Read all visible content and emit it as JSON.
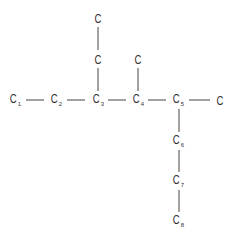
{
  "diagram": {
    "type": "skeletal-carbon-chain",
    "atoms": [
      {
        "id": "c1",
        "symbol": "C",
        "sub": "1",
        "x": 15,
        "y": 101
      },
      {
        "id": "c2",
        "symbol": "C",
        "sub": "2",
        "x": 56,
        "y": 101
      },
      {
        "id": "c3",
        "symbol": "C",
        "sub": "3",
        "x": 98,
        "y": 101
      },
      {
        "id": "c4",
        "symbol": "C",
        "sub": "4",
        "x": 138,
        "y": 101
      },
      {
        "id": "c5",
        "symbol": "C",
        "sub": "5",
        "x": 178,
        "y": 101
      },
      {
        "id": "c5-methyl",
        "symbol": "C",
        "sub": "",
        "x": 220,
        "y": 101
      },
      {
        "id": "c4-methyl",
        "symbol": "C",
        "sub": "",
        "x": 138,
        "y": 60
      },
      {
        "id": "c3-ethyl-1",
        "symbol": "C",
        "sub": "",
        "x": 98,
        "y": 60
      },
      {
        "id": "c3-ethyl-2",
        "symbol": "C",
        "sub": "",
        "x": 98,
        "y": 19
      },
      {
        "id": "c6",
        "symbol": "C",
        "sub": "6",
        "x": 178,
        "y": 142
      },
      {
        "id": "c7",
        "symbol": "C",
        "sub": "7",
        "x": 178,
        "y": 182
      },
      {
        "id": "c8",
        "symbol": "C",
        "sub": "8",
        "x": 178,
        "y": 222
      }
    ],
    "bonds": [
      {
        "x1": 26,
        "y1": 100,
        "x2": 44,
        "y2": 100
      },
      {
        "x1": 67,
        "y1": 100,
        "x2": 85,
        "y2": 100
      },
      {
        "x1": 108,
        "y1": 100,
        "x2": 126,
        "y2": 100
      },
      {
        "x1": 148,
        "y1": 100,
        "x2": 166,
        "y2": 100
      },
      {
        "x1": 189,
        "y1": 100,
        "x2": 210,
        "y2": 100
      },
      {
        "x1": 98,
        "y1": 27,
        "x2": 98,
        "y2": 50
      },
      {
        "x1": 98,
        "y1": 68,
        "x2": 98,
        "y2": 91
      },
      {
        "x1": 138,
        "y1": 68,
        "x2": 138,
        "y2": 91
      },
      {
        "x1": 179,
        "y1": 109,
        "x2": 179,
        "y2": 132
      },
      {
        "x1": 179,
        "y1": 150,
        "x2": 179,
        "y2": 172
      },
      {
        "x1": 179,
        "y1": 190,
        "x2": 179,
        "y2": 212
      }
    ],
    "colors": {
      "text": "#333333",
      "bond": "#444444",
      "background": "#ffffff"
    }
  }
}
